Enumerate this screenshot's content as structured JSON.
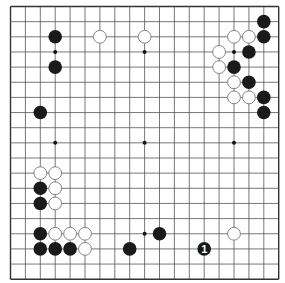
{
  "board": {
    "size": 19,
    "origin_x": 10.5,
    "origin_y": 6.5,
    "step_x": 14.9,
    "step_y": 15.15,
    "stone_radius": 6.8,
    "colors": {
      "background": "#ffffff",
      "line": "#555555",
      "border": "#333333",
      "black_stone": "#1a1a1a",
      "white_stone": "#ffffff",
      "white_outline": "#777777",
      "label_on_black": "#ffffff"
    }
  },
  "star_points": [
    [
      3,
      3
    ],
    [
      9,
      3
    ],
    [
      15,
      3
    ],
    [
      3,
      9
    ],
    [
      9,
      9
    ],
    [
      15,
      9
    ],
    [
      3,
      15
    ],
    [
      9,
      15
    ],
    [
      15,
      15
    ]
  ],
  "black_stones": [
    [
      3,
      2
    ],
    [
      3,
      4
    ],
    [
      17,
      1
    ],
    [
      17,
      2
    ],
    [
      16,
      3
    ],
    [
      15,
      4
    ],
    [
      16,
      5
    ],
    [
      17,
      6
    ],
    [
      17,
      7
    ],
    [
      2,
      7
    ],
    [
      2,
      12
    ],
    [
      2,
      13
    ],
    [
      2,
      15
    ],
    [
      2,
      16
    ],
    [
      3,
      16
    ],
    [
      4,
      16
    ],
    [
      10,
      15
    ],
    [
      8,
      16
    ]
  ],
  "white_stones": [
    [
      6,
      2
    ],
    [
      9,
      2
    ],
    [
      15,
      2
    ],
    [
      16,
      2
    ],
    [
      14,
      3
    ],
    [
      14,
      4
    ],
    [
      15,
      5
    ],
    [
      15,
      6
    ],
    [
      16,
      6
    ],
    [
      2,
      11
    ],
    [
      3,
      11
    ],
    [
      3,
      12
    ],
    [
      3,
      13
    ],
    [
      3,
      15
    ],
    [
      4,
      15
    ],
    [
      5,
      15
    ],
    [
      5,
      16
    ],
    [
      15,
      15
    ]
  ],
  "marked_stones": [
    {
      "col": 13,
      "row": 16,
      "color": "black",
      "label": "1"
    }
  ]
}
